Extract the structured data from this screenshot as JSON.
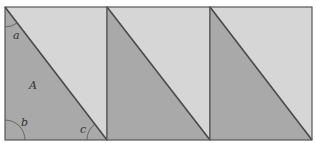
{
  "figure": {
    "colors": {
      "dark_fill": "#a9a9a9",
      "light_fill": "#d6d6d6",
      "stroke": "#4a4a4a",
      "arc": "#555555"
    },
    "panels": [
      {
        "x": 5,
        "y": 7,
        "w": 102,
        "h": 133
      },
      {
        "x": 107,
        "y": 7,
        "w": 103,
        "h": 133
      },
      {
        "x": 210,
        "y": 7,
        "w": 102,
        "h": 133
      }
    ],
    "labels": {
      "angle_a": "a",
      "area_A": "A",
      "angle_b": "b",
      "angle_c": "c"
    }
  }
}
